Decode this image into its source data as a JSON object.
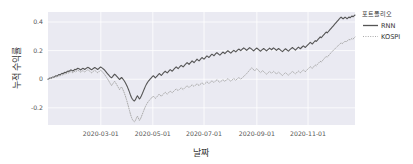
{
  "chart_data": {
    "type": "line",
    "title": "",
    "xlabel": "날짜",
    "ylabel": "누적 수익률",
    "grid": true,
    "legend_position": "right-outside",
    "legend_title": "포트폴리오",
    "style": "seaborn-darkgrid",
    "plot_bgcolor": "#eaeaf2",
    "grid_color": "#ffffff",
    "xlim": [
      "2020-01-02",
      "2020-12-30"
    ],
    "ylim": [
      -0.32,
      0.47
    ],
    "yticks": [
      -0.2,
      0,
      0.2,
      0.4
    ],
    "ytick_labels": [
      "-0.2",
      "0",
      "0.2",
      "0.4"
    ],
    "xticks": [
      "2020-03-01",
      "2020-05-01",
      "2020-07-01",
      "2020-09-01",
      "2020-11-01"
    ],
    "xtick_labels": [
      "2020-03-01",
      "2020-05-01",
      "2020-07-01",
      "2020-09-01",
      "2020-11-01"
    ],
    "xtick_positions": [
      0.1721,
      0.3415,
      0.5082,
      0.6803,
      0.847
    ],
    "series": [
      {
        "name": "RNN",
        "color": "#555555",
        "linestyle": "solid",
        "linewidth": 1.1,
        "values": [
          0.0,
          0.004,
          0.009,
          0.006,
          0.012,
          0.016,
          0.013,
          0.019,
          0.024,
          0.021,
          0.027,
          0.033,
          0.03,
          0.036,
          0.041,
          0.038,
          0.044,
          0.049,
          0.046,
          0.052,
          0.057,
          0.054,
          0.06,
          0.065,
          0.062,
          0.058,
          0.063,
          0.069,
          0.066,
          0.072,
          0.077,
          0.074,
          0.07,
          0.065,
          0.071,
          0.076,
          0.073,
          0.068,
          0.074,
          0.079,
          0.083,
          0.08,
          0.075,
          0.07,
          0.066,
          0.072,
          0.077,
          0.082,
          0.078,
          0.073,
          0.068,
          0.074,
          0.08,
          0.085,
          0.081,
          0.076,
          0.07,
          0.063,
          0.055,
          0.046,
          0.038,
          0.03,
          0.022,
          0.015,
          0.01,
          0.018,
          0.027,
          0.035,
          0.03,
          0.022,
          0.014,
          0.006,
          -0.002,
          0.005,
          0.012,
          0.005,
          -0.004,
          -0.014,
          -0.026,
          -0.04,
          -0.055,
          -0.072,
          -0.09,
          -0.11,
          -0.128,
          -0.14,
          -0.148,
          -0.152,
          -0.143,
          -0.128,
          -0.116,
          -0.126,
          -0.138,
          -0.13,
          -0.116,
          -0.1,
          -0.083,
          -0.066,
          -0.05,
          -0.036,
          -0.024,
          -0.014,
          -0.006,
          0.002,
          0.01,
          0.018,
          0.024,
          0.018,
          0.01,
          0.016,
          0.024,
          0.032,
          0.04,
          0.034,
          0.026,
          0.034,
          0.042,
          0.05,
          0.056,
          0.05,
          0.044,
          0.052,
          0.06,
          0.067,
          0.062,
          0.056,
          0.064,
          0.072,
          0.079,
          0.086,
          0.08,
          0.074,
          0.082,
          0.09,
          0.097,
          0.092,
          0.086,
          0.094,
          0.102,
          0.109,
          0.116,
          0.11,
          0.104,
          0.112,
          0.12,
          0.128,
          0.122,
          0.116,
          0.124,
          0.132,
          0.14,
          0.134,
          0.128,
          0.136,
          0.144,
          0.152,
          0.146,
          0.14,
          0.148,
          0.156,
          0.163,
          0.158,
          0.152,
          0.16,
          0.168,
          0.175,
          0.17,
          0.164,
          0.172,
          0.18,
          0.186,
          0.18,
          0.174,
          0.168,
          0.175,
          0.183,
          0.19,
          0.185,
          0.179,
          0.186,
          0.193,
          0.199,
          0.194,
          0.188,
          0.182,
          0.189,
          0.196,
          0.202,
          0.197,
          0.191,
          0.198,
          0.205,
          0.211,
          0.206,
          0.2,
          0.207,
          0.213,
          0.219,
          0.214,
          0.208,
          0.202,
          0.209,
          0.215,
          0.221,
          0.216,
          0.21,
          0.204,
          0.198,
          0.205,
          0.212,
          0.218,
          0.213,
          0.207,
          0.201,
          0.196,
          0.203,
          0.209,
          0.215,
          0.21,
          0.204,
          0.198,
          0.205,
          0.211,
          0.217,
          0.212,
          0.206,
          0.213,
          0.219,
          0.214,
          0.208,
          0.202,
          0.209,
          0.215,
          0.21,
          0.204,
          0.198,
          0.193,
          0.2,
          0.207,
          0.213,
          0.208,
          0.202,
          0.196,
          0.203,
          0.21,
          0.216,
          0.222,
          0.216,
          0.21,
          0.204,
          0.211,
          0.218,
          0.224,
          0.219,
          0.213,
          0.22,
          0.227,
          0.233,
          0.228,
          0.222,
          0.229,
          0.236,
          0.243,
          0.25,
          0.258,
          0.252,
          0.246,
          0.254,
          0.262,
          0.27,
          0.264,
          0.272,
          0.28,
          0.288,
          0.296,
          0.29,
          0.298,
          0.306,
          0.314,
          0.322,
          0.33,
          0.324,
          0.332,
          0.34,
          0.348,
          0.356,
          0.364,
          0.372,
          0.38,
          0.388,
          0.396,
          0.404,
          0.412,
          0.42,
          0.428,
          0.434,
          0.428,
          0.422,
          0.428,
          0.434,
          0.429,
          0.423,
          0.429,
          0.435,
          0.43,
          0.436,
          0.442,
          0.437,
          0.443,
          0.449
        ]
      },
      {
        "name": "KOSPI",
        "color": "#aaaaaa",
        "linestyle": "dotted",
        "linewidth": 1.0,
        "values": [
          0.0,
          0.003,
          0.007,
          0.004,
          0.009,
          0.013,
          0.01,
          0.015,
          0.019,
          0.016,
          0.021,
          0.026,
          0.022,
          0.028,
          0.033,
          0.029,
          0.035,
          0.04,
          0.036,
          0.042,
          0.047,
          0.043,
          0.049,
          0.054,
          0.05,
          0.045,
          0.051,
          0.056,
          0.052,
          0.058,
          0.063,
          0.059,
          0.054,
          0.049,
          0.055,
          0.06,
          0.056,
          0.05,
          0.056,
          0.062,
          0.066,
          0.062,
          0.056,
          0.05,
          0.045,
          0.051,
          0.057,
          0.062,
          0.057,
          0.051,
          0.045,
          0.051,
          0.058,
          0.063,
          0.058,
          0.05,
          0.042,
          0.033,
          0.023,
          0.012,
          0.001,
          -0.01,
          -0.022,
          -0.034,
          -0.044,
          -0.034,
          -0.024,
          -0.014,
          -0.024,
          -0.036,
          -0.048,
          -0.06,
          -0.073,
          -0.063,
          -0.053,
          -0.066,
          -0.082,
          -0.1,
          -0.12,
          -0.142,
          -0.166,
          -0.192,
          -0.218,
          -0.244,
          -0.266,
          -0.282,
          -0.292,
          -0.298,
          -0.288,
          -0.272,
          -0.258,
          -0.272,
          -0.288,
          -0.278,
          -0.262,
          -0.244,
          -0.226,
          -0.208,
          -0.192,
          -0.178,
          -0.166,
          -0.156,
          -0.148,
          -0.14,
          -0.132,
          -0.124,
          -0.118,
          -0.126,
          -0.134,
          -0.128,
          -0.12,
          -0.112,
          -0.104,
          -0.112,
          -0.12,
          -0.112,
          -0.104,
          -0.097,
          -0.091,
          -0.098,
          -0.105,
          -0.097,
          -0.09,
          -0.083,
          -0.089,
          -0.095,
          -0.088,
          -0.081,
          -0.074,
          -0.068,
          -0.074,
          -0.08,
          -0.073,
          -0.066,
          -0.06,
          -0.066,
          -0.072,
          -0.065,
          -0.058,
          -0.052,
          -0.046,
          -0.052,
          -0.058,
          -0.051,
          -0.045,
          -0.039,
          -0.045,
          -0.051,
          -0.044,
          -0.038,
          -0.032,
          -0.038,
          -0.044,
          -0.037,
          -0.031,
          -0.025,
          -0.031,
          -0.037,
          -0.03,
          -0.024,
          -0.018,
          -0.024,
          -0.03,
          -0.023,
          -0.017,
          -0.011,
          -0.017,
          -0.023,
          -0.016,
          -0.01,
          -0.004,
          -0.01,
          -0.016,
          -0.022,
          -0.015,
          -0.009,
          -0.003,
          -0.009,
          -0.015,
          -0.008,
          -0.002,
          0.004,
          -0.002,
          -0.008,
          -0.014,
          -0.007,
          -0.001,
          0.005,
          -0.001,
          -0.007,
          0.0,
          0.006,
          0.012,
          0.006,
          0.0,
          0.007,
          0.013,
          0.019,
          0.026,
          0.033,
          0.04,
          0.048,
          0.056,
          0.064,
          0.072,
          0.08,
          0.074,
          0.066,
          0.058,
          0.066,
          0.074,
          0.068,
          0.06,
          0.052,
          0.046,
          0.053,
          0.06,
          0.054,
          0.047,
          0.041,
          0.035,
          0.042,
          0.048,
          0.054,
          0.048,
          0.042,
          0.049,
          0.055,
          0.049,
          0.043,
          0.037,
          0.044,
          0.05,
          0.044,
          0.038,
          0.032,
          0.026,
          0.033,
          0.04,
          0.046,
          0.04,
          0.034,
          0.028,
          0.035,
          0.042,
          0.048,
          0.055,
          0.049,
          0.043,
          0.037,
          0.044,
          0.051,
          0.057,
          0.051,
          0.045,
          0.052,
          0.059,
          0.065,
          0.059,
          0.053,
          0.06,
          0.067,
          0.074,
          0.081,
          0.088,
          0.082,
          0.076,
          0.084,
          0.092,
          0.1,
          0.094,
          0.102,
          0.11,
          0.118,
          0.126,
          0.12,
          0.128,
          0.136,
          0.144,
          0.152,
          0.16,
          0.154,
          0.162,
          0.17,
          0.178,
          0.186,
          0.194,
          0.2,
          0.207,
          0.214,
          0.221,
          0.228,
          0.234,
          0.241,
          0.248,
          0.254,
          0.248,
          0.254,
          0.26,
          0.266,
          0.261,
          0.267,
          0.273,
          0.279,
          0.274,
          0.28,
          0.286,
          0.281,
          0.287,
          0.295
        ]
      }
    ]
  }
}
